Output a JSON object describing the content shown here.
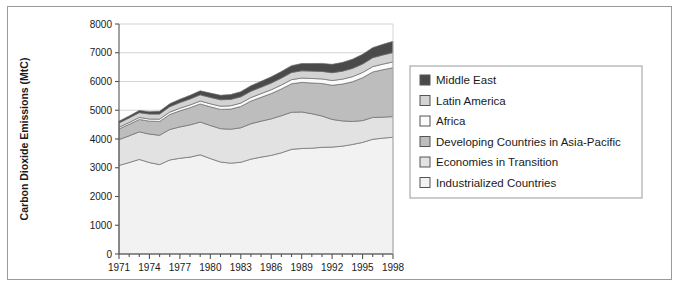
{
  "chart_data": {
    "type": "area",
    "stacked": true,
    "title": "",
    "xlabel": "",
    "ylabel": "Carbon Dioxide Emissions (MtC)",
    "xlim": [
      1971,
      1998
    ],
    "ylim": [
      0,
      8000
    ],
    "ytick_step": 1000,
    "yticks": [
      0,
      1000,
      2000,
      3000,
      4000,
      5000,
      6000,
      7000,
      8000
    ],
    "ytick_labels": [
      "0",
      "1000",
      "2000",
      "3000",
      "4000",
      "5000",
      "6000",
      "7000",
      "8000"
    ],
    "x": [
      1971,
      1972,
      1973,
      1974,
      1975,
      1976,
      1977,
      1978,
      1979,
      1980,
      1981,
      1982,
      1983,
      1984,
      1985,
      1986,
      1987,
      1988,
      1989,
      1990,
      1991,
      1992,
      1993,
      1994,
      1995,
      1996,
      1997,
      1998
    ],
    "xticks": [
      1971,
      1972,
      1973,
      1974,
      1975,
      1976,
      1977,
      1978,
      1979,
      1980,
      1981,
      1982,
      1983,
      1984,
      1985,
      1986,
      1987,
      1988,
      1989,
      1990,
      1991,
      1992,
      1993,
      1994,
      1995,
      1996,
      1997,
      1998
    ],
    "xtick_labels": [
      "1971",
      "",
      "",
      "1974",
      "",
      "",
      "1977",
      "",
      "",
      "1980",
      "",
      "",
      "1983",
      "",
      "",
      "1986",
      "",
      "",
      "1989",
      "",
      "",
      "1992",
      "",
      "",
      "1995",
      "",
      "",
      "1998"
    ],
    "xtick_labels_shown": [
      "1971",
      "1974",
      "1977",
      "1980",
      "1983",
      "1986",
      "1989",
      "1992",
      "1995",
      "1998"
    ],
    "grid": "horizontal",
    "legend_position": "right",
    "stack_order_bottom_to_top": [
      "Industrialized Countries",
      "Economies in Transition",
      "Developing Countries in Asia-Pacific",
      "Africa",
      "Latin America",
      "Middle East"
    ],
    "series": [
      {
        "name": "Industrialized Countries",
        "color": "#f2f2f2",
        "values": [
          3080,
          3180,
          3290,
          3180,
          3110,
          3270,
          3330,
          3370,
          3450,
          3320,
          3200,
          3160,
          3190,
          3300,
          3370,
          3430,
          3520,
          3640,
          3670,
          3680,
          3710,
          3720,
          3750,
          3810,
          3880,
          3990,
          4030,
          4060
        ]
      },
      {
        "name": "Economies in Transition",
        "color": "#e2e2e2",
        "values": [
          900,
          930,
          960,
          990,
          1020,
          1060,
          1090,
          1120,
          1140,
          1150,
          1160,
          1180,
          1200,
          1230,
          1250,
          1270,
          1290,
          1290,
          1270,
          1200,
          1090,
          960,
          880,
          800,
          760,
          760,
          730,
          720
        ]
      },
      {
        "name": "Developing Countries in Asia-Pacific",
        "color": "#bdbdbd",
        "values": [
          370,
          400,
          430,
          450,
          480,
          520,
          560,
          600,
          630,
          650,
          670,
          700,
          740,
          790,
          830,
          880,
          930,
          990,
          1030,
          1070,
          1130,
          1190,
          1280,
          1380,
          1490,
          1580,
          1650,
          1700
        ]
      },
      {
        "name": "Africa",
        "color": "#fbfbfb",
        "values": [
          60,
          65,
          70,
          75,
          80,
          85,
          90,
          95,
          100,
          105,
          110,
          115,
          118,
          122,
          128,
          133,
          138,
          144,
          150,
          155,
          160,
          165,
          170,
          176,
          182,
          188,
          194,
          200
        ]
      },
      {
        "name": "Latin America",
        "color": "#d3d3d3",
        "values": [
          150,
          158,
          167,
          172,
          178,
          188,
          196,
          206,
          216,
          222,
          224,
          222,
          218,
          220,
          224,
          232,
          240,
          248,
          252,
          256,
          262,
          270,
          278,
          288,
          296,
          308,
          318,
          326
        ]
      },
      {
        "name": "Middle East",
        "color": "#4a4a4a",
        "values": [
          60,
          68,
          76,
          84,
          94,
          104,
          116,
          128,
          140,
          150,
          158,
          168,
          180,
          192,
          204,
          216,
          228,
          240,
          252,
          264,
          278,
          292,
          306,
          320,
          336,
          352,
          370,
          390
        ]
      }
    ],
    "totals": [
      4620,
      4801,
      4993,
      4951,
      4962,
      5227,
      5382,
      5519,
      5676,
      5597,
      5522,
      5545,
      5646,
      5854,
      6006,
      6161,
      6346,
      6552,
      6624,
      6625,
      6630,
      6597,
      6664,
      6774,
      6944,
      7178,
      7292,
      7396
    ]
  },
  "legend": {
    "items": [
      {
        "label": "Middle East",
        "color": "#4a4a4a"
      },
      {
        "label": "Latin America",
        "color": "#d3d3d3"
      },
      {
        "label": "Africa",
        "color": "#fbfbfb"
      },
      {
        "label": "Developing Countries in Asia-Pacific",
        "color": "#bdbdbd"
      },
      {
        "label": "Economies in Transition",
        "color": "#e2e2e2"
      },
      {
        "label": "Industrialized Countries",
        "color": "#f2f2f2"
      }
    ]
  },
  "style": {
    "frame_border": "#9a9a9a",
    "axis_color": "#555555",
    "grid_color": "#c9c9c9",
    "area_outline": "#6b6b6b",
    "background": "#ffffff"
  }
}
